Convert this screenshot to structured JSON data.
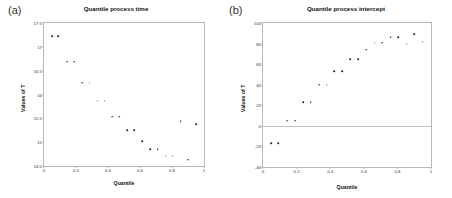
{
  "figure": {
    "panels": [
      {
        "tag": "(a)",
        "title": "Quantile process time",
        "xlabel": "Quantile",
        "ylabel": "Values of T"
      },
      {
        "tag": "(b)",
        "title": "Quantile process intercept",
        "xlabel": "Quantile",
        "ylabel": "Values of T"
      }
    ]
  },
  "chart_data": [
    {
      "type": "scatter",
      "title": "Quantile process time",
      "xlabel": "Quantile",
      "ylabel": "Values of T",
      "xlim": [
        0,
        1
      ],
      "ylim": [
        14.5,
        17.5
      ],
      "xticks": [
        0,
        0.2,
        0.4,
        0.6,
        0.8,
        1
      ],
      "xticklabels": [
        "0",
        "0.2",
        "0.4",
        "0.6",
        "0.8",
        "1"
      ],
      "yticks": [
        14.5,
        15,
        15.5,
        16,
        16.5,
        17,
        17.5
      ],
      "yticklabels": [
        "14.5",
        "15",
        "15.5",
        "16",
        "16.5",
        "17",
        "17.5"
      ],
      "grid": false,
      "legend": "none",
      "x": [
        0.05,
        0.09,
        0.145,
        0.19,
        0.24,
        0.285,
        0.335,
        0.38,
        0.425,
        0.47,
        0.52,
        0.565,
        0.615,
        0.665,
        0.71,
        0.76,
        0.805,
        0.855,
        0.9,
        0.95
      ],
      "y": [
        17.22,
        17.22,
        16.69,
        16.69,
        16.25,
        16.25,
        15.87,
        15.87,
        15.53,
        15.53,
        15.25,
        15.25,
        15.02,
        14.85,
        14.85,
        14.72,
        14.72,
        15.44,
        14.63,
        15.38
      ]
    },
    {
      "type": "scatter",
      "title": "Quantile process intercept",
      "xlabel": "Quantile",
      "ylabel": "Values of T",
      "xlim": [
        0,
        1
      ],
      "ylim": [
        -40,
        100
      ],
      "xticks": [
        0,
        0.2,
        0.4,
        0.6,
        0.8,
        1
      ],
      "xticklabels": [
        "0",
        "0.2",
        "0.4",
        "0.6",
        "0.8",
        "1"
      ],
      "yticks": [
        -40,
        -20,
        0,
        20,
        40,
        60,
        80,
        100
      ],
      "yticklabels": [
        "-40",
        "-20",
        "0",
        "20",
        "40",
        "60",
        "80",
        "100"
      ],
      "grid": false,
      "legend": "none",
      "x": [
        0.05,
        0.09,
        0.145,
        0.19,
        0.24,
        0.285,
        0.335,
        0.38,
        0.425,
        0.47,
        0.52,
        0.565,
        0.615,
        0.665,
        0.71,
        0.76,
        0.805,
        0.855,
        0.9,
        0.95
      ],
      "y": [
        -17,
        -17,
        5,
        5,
        23,
        23,
        40,
        40,
        53,
        53,
        65,
        65,
        74,
        81,
        81,
        86,
        86,
        80,
        89,
        82
      ]
    }
  ]
}
